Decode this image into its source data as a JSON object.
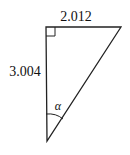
{
  "diagram": {
    "type": "right-triangle",
    "labels": {
      "top_side": "2.012",
      "left_side": "3.004",
      "angle": "α"
    },
    "right_angle_marker": "top-left",
    "colors": {
      "stroke": "#222222",
      "background": "#ffffff"
    }
  }
}
